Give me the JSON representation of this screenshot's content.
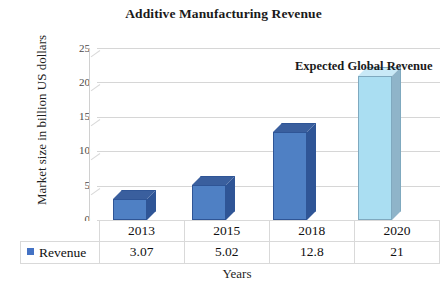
{
  "chart_data": {
    "type": "bar",
    "title": "Additive Manufacturing Revenue",
    "xlabel": "Years",
    "ylabel": "Market size in billion US dollars",
    "categories": [
      "2013",
      "2015",
      "2018",
      "2020"
    ],
    "values": [
      3.07,
      5.02,
      12.8,
      21
    ],
    "value_labels": [
      "3.07",
      "5.02",
      "12.8",
      "21"
    ],
    "series": [
      {
        "name": "Revenue",
        "values": [
          3.07,
          5.02,
          12.8,
          21
        ]
      }
    ],
    "ylim": [
      0,
      25
    ],
    "yticks": [
      "0",
      "5",
      "10",
      "15",
      "20",
      "25"
    ],
    "grid": true,
    "legend_position": "bottom-left-table",
    "annotations": [
      {
        "text": "Expected Global Revenue",
        "target_category": "2020"
      }
    ],
    "colors": {
      "bar_front": "#4f80c4",
      "bar_top": "#3a5f9e",
      "bar_side": "#2f5596",
      "highlight_front": "#aadef2",
      "highlight_top": "#c9e9f7",
      "highlight_side": "#8fb4c9",
      "gridline": "#d6d6d6",
      "legend_swatch": "#4472c4",
      "text": "#1a1a1a"
    },
    "highlight_category": "2020"
  },
  "legend": {
    "row_label": "Revenue",
    "swatch_icon": "square-marker-icon"
  }
}
